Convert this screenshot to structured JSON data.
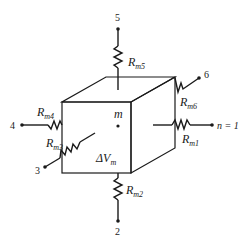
{
  "diagram": {
    "center_node": "m",
    "volume_label": "ΔV",
    "volume_sub": "m",
    "nodes": [
      {
        "id": "1",
        "label": "n = 1"
      },
      {
        "id": "2",
        "label": "2"
      },
      {
        "id": "3",
        "label": "3"
      },
      {
        "id": "4",
        "label": "4"
      },
      {
        "id": "5",
        "label": "5"
      },
      {
        "id": "6",
        "label": "6"
      }
    ],
    "resistors": [
      {
        "main": "R",
        "sub": "m1"
      },
      {
        "main": "R",
        "sub": "m2"
      },
      {
        "main": "R",
        "sub": "m3"
      },
      {
        "main": "R",
        "sub": "m4"
      },
      {
        "main": "R",
        "sub": "m5"
      },
      {
        "main": "R",
        "sub": "m6"
      }
    ],
    "colors": {
      "line": "#1a1a1a",
      "shade": "#bdbdbd",
      "face": "#ffffff"
    }
  }
}
